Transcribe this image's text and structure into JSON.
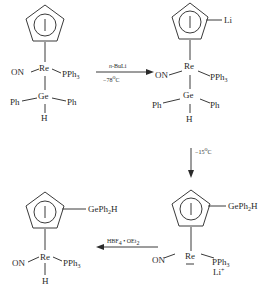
{
  "diagram": {
    "type": "reaction-scheme",
    "compounds": [
      {
        "id": "c1",
        "position": "top-left",
        "ring": "cyclopentadienyl",
        "ring_substituent": null,
        "metal": "Re",
        "ligands": {
          "left": "ON",
          "right": "PPh3"
        },
        "below": {
          "atom": "Ge",
          "left": "Ph",
          "right": "Ph",
          "bottom": "H"
        }
      },
      {
        "id": "c2",
        "position": "top-right",
        "ring": "cyclopentadienyl",
        "ring_substituent": "Li",
        "metal": "Re",
        "ligands": {
          "left": "ON",
          "right": "PPh3"
        },
        "below": {
          "atom": "Ge",
          "left": "Ph",
          "right": "Ph",
          "bottom": "H"
        }
      },
      {
        "id": "c3",
        "position": "bottom-right",
        "ring": "cyclopentadienyl",
        "ring_substituent": "GePh2H",
        "metal": "Re",
        "metal_charge": "−",
        "ligands": {
          "left": "ON",
          "right": "PPh3"
        },
        "counterion": "Li+"
      },
      {
        "id": "c4",
        "position": "bottom-left",
        "ring": "cyclopentadienyl",
        "ring_substituent": "GePh2H",
        "metal": "Re",
        "ligands": {
          "left": "ON",
          "right": "PPh3"
        },
        "below": {
          "atom": "H"
        }
      }
    ],
    "arrows": [
      {
        "from": "c1",
        "to": "c2",
        "direction": "right",
        "above": "n-BuLi",
        "below": "−78°C"
      },
      {
        "from": "c2",
        "to": "c3",
        "direction": "down",
        "label": "−15°C"
      },
      {
        "from": "c3",
        "to": "c4",
        "direction": "left",
        "above": "HBF4·OEt2"
      }
    ]
  },
  "labels": {
    "on": "ON",
    "re": "Re",
    "ge": "Ge",
    "ph": "Ph",
    "h": "H",
    "li": "Li",
    "pph": "PPh",
    "three": "3",
    "geph": "GePh",
    "two": "2",
    "h_tail": "H",
    "plus": "+",
    "minus": "−",
    "arrow1_top_italic": "n",
    "arrow1_top_rest": "-BuLi",
    "arrow1_bottom": "−78",
    "arrow2_label": "−15",
    "deg": "o",
    "celsius": "C",
    "arrow3_hbf": "HBF",
    "arrow3_four": "4",
    "arrow3_dot": " • OEt",
    "arrow3_two": "2"
  }
}
